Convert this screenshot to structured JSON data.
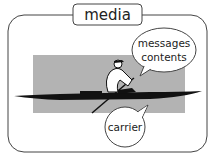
{
  "diagram": {
    "title": "media",
    "bubble_top": {
      "line1": "messages",
      "line2": "contents"
    },
    "bubble_bottom": {
      "label": "carrier"
    },
    "colors": {
      "frame": "#333333",
      "background_rect": "#b3b3b3",
      "boat": "#111111"
    }
  }
}
